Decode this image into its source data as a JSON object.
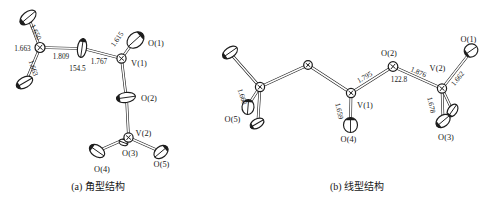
{
  "figure": {
    "panel_a": {
      "caption": "(a) 角型结构",
      "atoms": {
        "o1": "O(1)",
        "v1": "V(1)",
        "o2": "O(2)",
        "v2": "V(2)",
        "o3": "O(3)",
        "o4": "O(4)",
        "o5": "O(5)"
      },
      "bonds": {
        "terminal_top": "1.650",
        "terminal_left": "1.663",
        "terminal_bottom": "1.663",
        "bridge_left": "1.809",
        "bridge_right": "1.767",
        "v1_o1": "1.615"
      },
      "angle": "154.5"
    },
    "panel_b": {
      "caption": "(b) 线型结构",
      "atoms": {
        "o1": "O(1)",
        "o2": "O(2)",
        "o3": "O(3)",
        "o4": "O(4)",
        "o5": "O(5)",
        "v1": "V(1)",
        "v2": "V(2)"
      },
      "bonds": {
        "terminal_left": "1.668",
        "v1_o4": "1.659",
        "v1_o2": "1.795",
        "o2_v2": "1.876",
        "v2_o1": "1.662",
        "v2_o3": "1.678"
      },
      "angle": "122.8"
    }
  }
}
